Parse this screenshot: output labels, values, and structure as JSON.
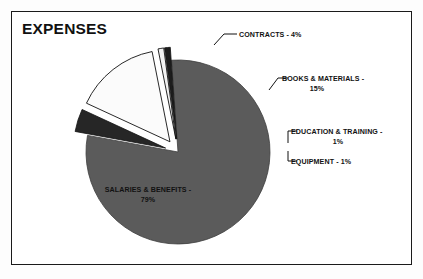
{
  "figure": {
    "title": "EXPENSES",
    "border_color": "#1a1a1a",
    "background": "#ffffff"
  },
  "chart_data": {
    "type": "pie",
    "title": "EXPENSES",
    "xlabel": "",
    "ylabel": "",
    "legend": "none (direct slice labels with leader lines)",
    "grid": false,
    "total_percent": 100,
    "categories": [
      "SALARIES & BENEFITS",
      "CONTRACTS",
      "BOOKS & MATERIALS",
      "EDUCATION & TRAINING",
      "EQUIPMENT"
    ],
    "values": [
      79,
      4,
      15,
      1,
      1
    ],
    "slices": [
      {
        "name": "SALARIES & BENEFITS",
        "value": 79,
        "label_line1": "SALARIES & BENEFITS -",
        "label_line2": "79%",
        "percent_text": "79%",
        "color": "#5b5b5b",
        "exploded": false,
        "label_position": "inside"
      },
      {
        "name": "CONTRACTS",
        "value": 4,
        "label_line1": "CONTRACTS  - 4%",
        "label_line2": "",
        "percent_text": "4%",
        "color": "#262626",
        "exploded": true,
        "label_position": "outside-top"
      },
      {
        "name": "BOOKS & MATERIALS",
        "value": 15,
        "label_line1": "BOOKS & MATERIALS -",
        "label_line2": "15%",
        "percent_text": "15%",
        "color": "#fbfbfb",
        "exploded": true,
        "label_position": "outside-right"
      },
      {
        "name": "EDUCATION & TRAINING",
        "value": 1,
        "label_line1": "EDUCATION & TRAINING -",
        "label_line2": "1%",
        "percent_text": "1%",
        "color": "#f2f2f2",
        "exploded": true,
        "label_position": "outside-right"
      },
      {
        "name": "EQUIPMENT",
        "value": 1,
        "label_line1": "EQUIPMENT - 1%",
        "label_line2": "",
        "percent_text": "1%",
        "color": "#1c1c1c",
        "exploded": true,
        "label_position": "outside-right"
      }
    ]
  }
}
